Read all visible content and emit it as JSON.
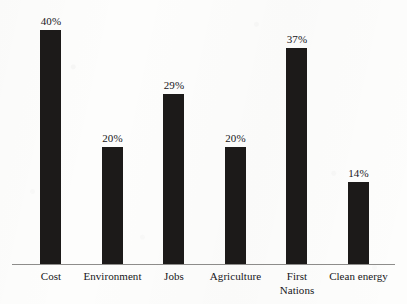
{
  "chart_data": {
    "type": "bar",
    "title": "",
    "subtitle": "",
    "xlabel": "",
    "ylabel": "",
    "grid": false,
    "legend": false,
    "ylim": [
      0,
      45
    ],
    "categories": [
      "Cost",
      "Environment",
      "Jobs",
      "Agriculture",
      "First\nNations",
      "Clean energy"
    ],
    "values": [
      40,
      20,
      29,
      20,
      37,
      14
    ],
    "value_labels": [
      "40%",
      "20%",
      "29%",
      "20%",
      "37%",
      "14%"
    ],
    "bar_color": "#1c1a19",
    "axis_color": "#8e8d8b",
    "background_color": "#fdfdfc",
    "text_color": "#17161a"
  },
  "axis": {
    "baseline_name": "x-axis-baseline"
  }
}
